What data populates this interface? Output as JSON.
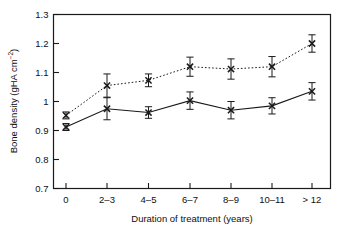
{
  "chart_data": {
    "type": "line",
    "title": "",
    "xlabel": "Duration of treatment (years)",
    "ylabel": "Bone density (gHA cm",
    "ylabel_sup": "−2",
    "ylabel_close": ")",
    "categories": [
      "0",
      "2–3",
      "4–5",
      "6–7",
      "8–9",
      "10–11",
      "> 12"
    ],
    "ytick_labels": [
      "1.3",
      "1.2",
      "1.1",
      "1",
      "0.9",
      "0.8",
      "0.7"
    ],
    "ytick_values": [
      1.3,
      1.2,
      1.1,
      1.0,
      0.9,
      0.8,
      0.7
    ],
    "ylim": [
      0.7,
      1.3
    ],
    "grid": false,
    "legend": "none",
    "series": [
      {
        "name": "upper-series",
        "line_style": "dotted",
        "marker": "cross",
        "values": [
          0.952,
          1.055,
          1.073,
          1.12,
          1.112,
          1.12,
          1.2
        ],
        "errors": [
          0.012,
          0.04,
          0.022,
          0.033,
          0.035,
          0.035,
          0.03
        ]
      },
      {
        "name": "lower-series",
        "line_style": "solid",
        "marker": "cross",
        "values": [
          0.912,
          0.975,
          0.962,
          1.003,
          0.97,
          0.985,
          1.035
        ],
        "errors": [
          0.012,
          0.038,
          0.02,
          0.03,
          0.03,
          0.028,
          0.03
        ]
      }
    ]
  },
  "colors": {
    "axis": "#1a1a1a",
    "series_upper": "#1a1a1a",
    "series_lower": "#1a1a1a",
    "background": "#ffffff"
  }
}
